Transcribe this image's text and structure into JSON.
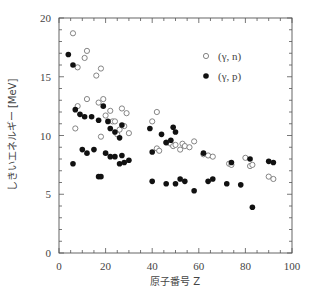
{
  "chart_data": {
    "type": "scatter",
    "title": "",
    "xlabel": "原子番号 Z",
    "ylabel": "しきいエネルギー [MeV]",
    "xlim": [
      0,
      100
    ],
    "ylim": [
      0,
      20
    ],
    "x_ticks": [
      0,
      20,
      40,
      60,
      80,
      100
    ],
    "y_ticks": [
      0,
      5,
      10,
      15,
      20
    ],
    "grid": false,
    "legend_position": "upper right (inside)",
    "series": [
      {
        "name": "(γ, n)",
        "marker": "open-circle",
        "points": [
          [
            6,
            18.7
          ],
          [
            8,
            15.8
          ],
          [
            11,
            16.6
          ],
          [
            12,
            17.2
          ],
          [
            16,
            15.1
          ],
          [
            18,
            15.7
          ],
          [
            7,
            10.6
          ],
          [
            8,
            12.5
          ],
          [
            12,
            13.1
          ],
          [
            17,
            12.8
          ],
          [
            19,
            13.1
          ],
          [
            18,
            9.9
          ],
          [
            20,
            11.7
          ],
          [
            22,
            12.1
          ],
          [
            23,
            11.2
          ],
          [
            24,
            11.2
          ],
          [
            25,
            10.1
          ],
          [
            26,
            10.5
          ],
          [
            27,
            12.3
          ],
          [
            28,
            10.8
          ],
          [
            29,
            11.9
          ],
          [
            30,
            10.2
          ],
          [
            40,
            11.2
          ],
          [
            42,
            12.0
          ],
          [
            42,
            8.9
          ],
          [
            43,
            8.7
          ],
          [
            46,
            9.4
          ],
          [
            47,
            9.4
          ],
          [
            48,
            9.3
          ],
          [
            49,
            9.1
          ],
          [
            50,
            9.2
          ],
          [
            52,
            8.8
          ],
          [
            53,
            9.3
          ],
          [
            54,
            9.1
          ],
          [
            56,
            9.0
          ],
          [
            58,
            9.5
          ],
          [
            62,
            8.4
          ],
          [
            64,
            8.3
          ],
          [
            66,
            8.2
          ],
          [
            73,
            7.6
          ],
          [
            74,
            7.5
          ],
          [
            80,
            8.1
          ],
          [
            82,
            7.4
          ],
          [
            83,
            7.5
          ],
          [
            90,
            6.5
          ],
          [
            92,
            6.3
          ]
        ]
      },
      {
        "name": "(γ, p)",
        "marker": "filled-circle",
        "points": [
          [
            4,
            16.9
          ],
          [
            6,
            16.0
          ],
          [
            7,
            12.2
          ],
          [
            9,
            11.8
          ],
          [
            11,
            11.6
          ],
          [
            14,
            11.6
          ],
          [
            17,
            11.3
          ],
          [
            19,
            12.5
          ],
          [
            21,
            11.2
          ],
          [
            22,
            10.6
          ],
          [
            24,
            10.3
          ],
          [
            26,
            9.8
          ],
          [
            27,
            10.9
          ],
          [
            6,
            7.6
          ],
          [
            10,
            8.8
          ],
          [
            12,
            8.5
          ],
          [
            15,
            8.8
          ],
          [
            17,
            6.5
          ],
          [
            18,
            6.5
          ],
          [
            20,
            8.5
          ],
          [
            22,
            8.2
          ],
          [
            24,
            8.2
          ],
          [
            26,
            7.6
          ],
          [
            27,
            8.3
          ],
          [
            28,
            7.7
          ],
          [
            30,
            7.9
          ],
          [
            39,
            10.6
          ],
          [
            40,
            8.6
          ],
          [
            40,
            6.1
          ],
          [
            44,
            10.1
          ],
          [
            46,
            9.4
          ],
          [
            48,
            9.6
          ],
          [
            49,
            10.7
          ],
          [
            50,
            10.3
          ],
          [
            46,
            5.9
          ],
          [
            50,
            5.9
          ],
          [
            52,
            6.3
          ],
          [
            54,
            6.1
          ],
          [
            58,
            5.3
          ],
          [
            62,
            8.5
          ],
          [
            64,
            6.1
          ],
          [
            66,
            6.3
          ],
          [
            72,
            5.9
          ],
          [
            74,
            7.7
          ],
          [
            78,
            5.8
          ],
          [
            82,
            8.0
          ],
          [
            83,
            3.9
          ],
          [
            90,
            7.8
          ],
          [
            92,
            7.7
          ]
        ]
      }
    ]
  },
  "legend": {
    "items": [
      {
        "label": "(γ,  n)",
        "marker": "open-circle"
      },
      {
        "label": "(γ,  p)",
        "marker": "filled-circle"
      }
    ]
  },
  "axes": {
    "xlabel": "原子番号 Z",
    "ylabel": "しきいエネルギー [MeV]",
    "x_tick_labels": [
      "0",
      "20",
      "40",
      "60",
      "80",
      "100"
    ],
    "y_tick_labels": [
      "0",
      "5",
      "10",
      "15",
      "20"
    ]
  },
  "colors": {
    "axis": "#555555",
    "filled_marker": "#111111",
    "open_marker_stroke": "#777777",
    "text": "#444444"
  }
}
